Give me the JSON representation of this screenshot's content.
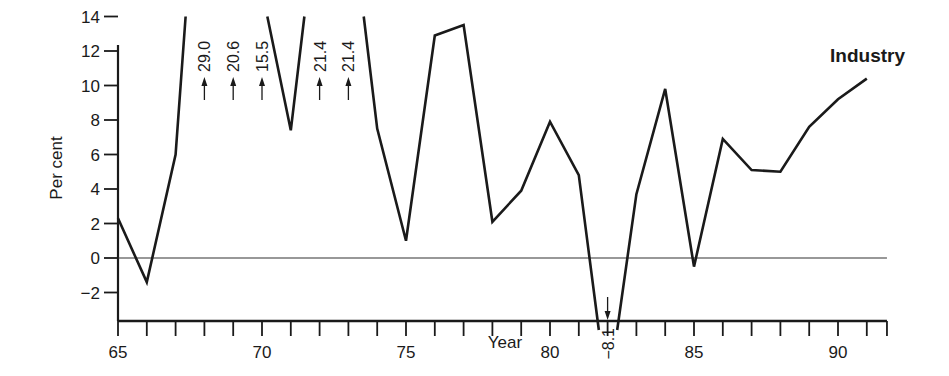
{
  "chart_data": {
    "type": "line",
    "title": "Industry",
    "xlabel": "Year",
    "ylabel": "Per cent",
    "xlim": [
      65,
      91.7
    ],
    "ylim": [
      -2,
      14
    ],
    "x_ticks": [
      65,
      70,
      75,
      80,
      85,
      90
    ],
    "y_ticks": [
      -2,
      0,
      2,
      4,
      6,
      8,
      10,
      12,
      14
    ],
    "grid": false,
    "zero_line": true,
    "legend": null,
    "series": [
      {
        "name": "Industry",
        "x": [
          65,
          66,
          67,
          68,
          69,
          70,
          71,
          72,
          73,
          74,
          75,
          76,
          77,
          78,
          79,
          80,
          81,
          82,
          83,
          84,
          85,
          86,
          87,
          88,
          89,
          90,
          91
        ],
        "values": [
          2.3,
          -1.4,
          6.0,
          29.0,
          20.6,
          15.5,
          7.4,
          21.4,
          21.4,
          7.5,
          1.0,
          12.9,
          13.5,
          2.1,
          3.9,
          7.9,
          4.8,
          -8.1,
          3.7,
          9.8,
          -0.5,
          6.9,
          5.1,
          5.0,
          7.6,
          9.2,
          10.4
        ]
      }
    ],
    "annotations": [
      {
        "x": 68,
        "label": "29.0",
        "direction": "up"
      },
      {
        "x": 69,
        "label": "20.6",
        "direction": "up"
      },
      {
        "x": 70,
        "label": "15.5",
        "direction": "up"
      },
      {
        "x": 72,
        "label": "21.4",
        "direction": "up"
      },
      {
        "x": 73,
        "label": "21.4",
        "direction": "up"
      },
      {
        "x": 82,
        "label": "-8.1",
        "direction": "down"
      }
    ]
  },
  "labels": {
    "title": "Industry",
    "xlabel": "Year",
    "ylabel": "Per cent"
  }
}
